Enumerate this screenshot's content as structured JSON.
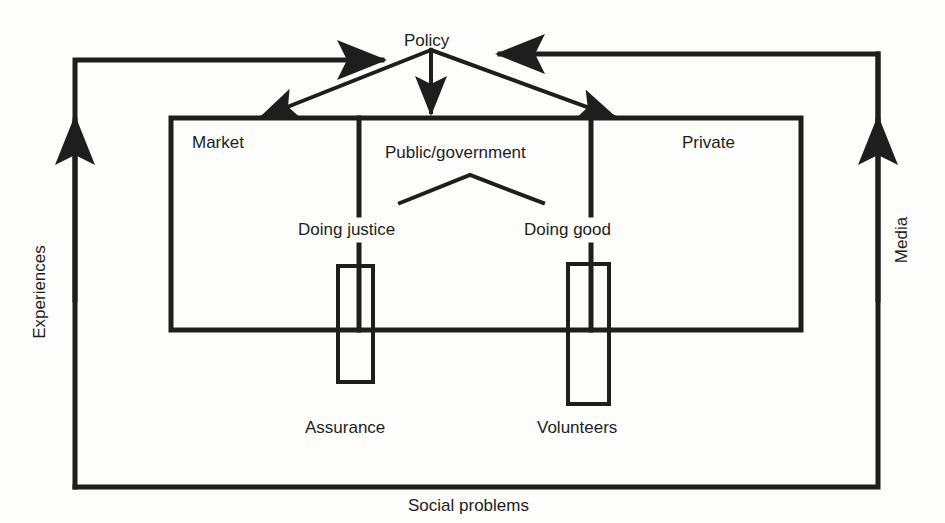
{
  "diagram": {
    "nodes": {
      "policy": "Policy",
      "market": "Market",
      "public_government": "Public/government",
      "private": "Private",
      "doing_justice": "Doing justice",
      "doing_good": "Doing good",
      "assurance": "Assurance",
      "volunteers": "Volunteers"
    },
    "flows": {
      "experiences": "Experiences",
      "media": "Media",
      "social_problems": "Social problems"
    },
    "stroke_color": "#1e1e1e",
    "background": "#fdfdfb"
  }
}
